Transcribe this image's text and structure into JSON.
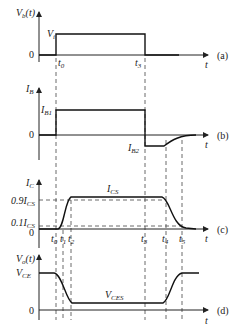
{
  "panels": {
    "a": {
      "ylabel": "V",
      "ylabel_sub": "b",
      "ylabel_suffix": "(t)",
      "level_label": "V",
      "level_sub": "i",
      "zero": "0",
      "xlabel": "t",
      "tag": "(a)",
      "ticks": [
        {
          "t": "t",
          "s": "0"
        },
        {
          "t": "t",
          "s": "3"
        }
      ]
    },
    "b": {
      "ylabel": "I",
      "ylabel_sub": "B",
      "high_label": "I",
      "high_sub": "B1",
      "low_label": "I",
      "low_sub": "B2",
      "zero": "0",
      "xlabel": "t",
      "tag": "(b)"
    },
    "c": {
      "ylabel": "I",
      "ylabel_sub": "C",
      "top_label": "I",
      "top_sub": "CS",
      "p90_label": "0.9I",
      "p90_sub": "CS",
      "p10_label": "0.1I",
      "p10_sub": "CS",
      "zero": "0",
      "xlabel": "t",
      "tag": "(c)",
      "ticks": [
        {
          "t": "t",
          "s": "0"
        },
        {
          "t": "t",
          "s": "1"
        },
        {
          "t": "t",
          "s": "2"
        },
        {
          "t": "t",
          "s": "3"
        },
        {
          "t": "t",
          "s": "4"
        },
        {
          "t": "t",
          "s": "5"
        }
      ]
    },
    "d": {
      "ylabel": "V",
      "ylabel_sub": "o",
      "ylabel_suffix": "(t)",
      "high_label": "V",
      "high_sub": "CE",
      "low_label": "V",
      "low_sub": "CES",
      "zero": "0",
      "xlabel": "t",
      "tag": "(d)"
    }
  }
}
